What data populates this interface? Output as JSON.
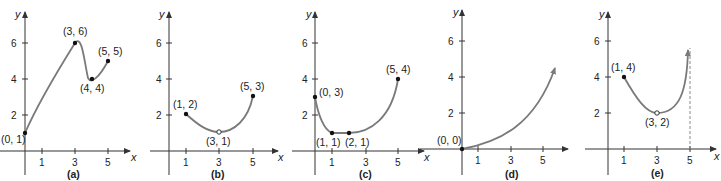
{
  "figure": {
    "panels": [
      {
        "label": "(a)",
        "x_axis_label": "x",
        "y_axis_label": "y",
        "x_ticks": [
          "1",
          "3",
          "5"
        ],
        "y_ticks": [
          "2",
          "4",
          "6"
        ],
        "points": [
          {
            "text": "(0, 1)",
            "x": 0,
            "y": 1,
            "filled": true
          },
          {
            "text": "(3, 6)",
            "x": 3,
            "y": 6,
            "filled": true
          },
          {
            "text": "(4, 4)",
            "x": 4,
            "y": 4,
            "filled": true
          },
          {
            "text": "(5, 5)",
            "x": 5,
            "y": 5,
            "filled": true
          }
        ]
      },
      {
        "label": "(b)",
        "x_axis_label": "x",
        "y_axis_label": "y",
        "x_ticks": [
          "1",
          "3",
          "5"
        ],
        "y_ticks": [
          "2",
          "4",
          "6"
        ],
        "points": [
          {
            "text": "(1, 2)",
            "x": 1,
            "y": 2,
            "filled": true
          },
          {
            "text": "(3, 1)",
            "x": 3,
            "y": 1,
            "filled": false
          },
          {
            "text": "(5, 3)",
            "x": 5,
            "y": 3,
            "filled": true
          }
        ]
      },
      {
        "label": "(c)",
        "x_axis_label": "x",
        "y_axis_label": "y",
        "x_ticks": [
          "1",
          "3",
          "5"
        ],
        "y_ticks": [
          "2",
          "4",
          "6"
        ],
        "points": [
          {
            "text": "(0, 3)",
            "x": 0,
            "y": 3,
            "filled": true
          },
          {
            "text": "(1, 1)",
            "x": 1,
            "y": 1,
            "filled": true
          },
          {
            "text": "(2, 1)",
            "x": 2,
            "y": 1,
            "filled": true
          },
          {
            "text": "(5, 4)",
            "x": 5,
            "y": 4,
            "filled": true
          }
        ]
      },
      {
        "label": "(d)",
        "x_axis_label": "x",
        "y_axis_label": "y",
        "x_ticks": [
          "1",
          "3",
          "5"
        ],
        "y_ticks": [
          "2",
          "4",
          "6"
        ],
        "points": [
          {
            "text": "(0, 0)",
            "x": 0,
            "y": 0,
            "filled": true
          }
        ]
      },
      {
        "label": "(e)",
        "x_axis_label": "x",
        "y_axis_label": "y",
        "x_ticks": [
          "1",
          "3",
          "5"
        ],
        "y_ticks": [
          "2",
          "4",
          "6"
        ],
        "asymptote": "x = 5",
        "points": [
          {
            "text": "(1, 4)",
            "x": 1,
            "y": 4,
            "filled": true
          },
          {
            "text": "(3, 2)",
            "x": 3,
            "y": 2,
            "filled": false
          }
        ]
      }
    ]
  },
  "colors": {
    "curve": "#7a7a7a",
    "axis": "#333333",
    "point": "#111111",
    "asymptote": "#888888"
  }
}
